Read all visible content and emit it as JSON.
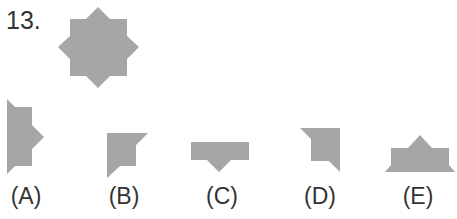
{
  "question": {
    "number": "13.",
    "fill_color": "#a6a6a6",
    "text_color": "#333333"
  },
  "options": [
    {
      "label": "(A)"
    },
    {
      "label": "(B)"
    },
    {
      "label": "(C)"
    },
    {
      "label": "(D)"
    },
    {
      "label": "(E)"
    }
  ]
}
